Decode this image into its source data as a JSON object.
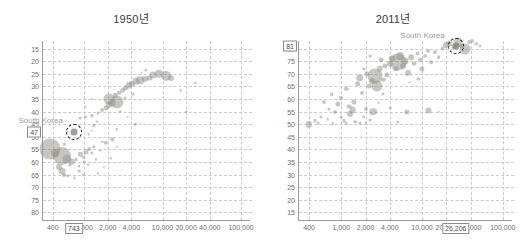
{
  "figure": {
    "panels": [
      {
        "id": "1950",
        "title": "1950년",
        "country_label": "South Korea",
        "y_callout": "47",
        "x_callout": "743"
      },
      {
        "id": "2011",
        "title": "2011년",
        "country_label": "South Korea",
        "y_callout": "81",
        "x_callout": "26,206"
      }
    ]
  },
  "chart_data": [
    {
      "type": "scatter",
      "title": "1950년",
      "xlabel": "",
      "ylabel": "",
      "xscale": "log",
      "xlim": [
        300,
        130000
      ],
      "ylim": [
        12,
        83
      ],
      "grid": true,
      "legend": null,
      "xticks": [
        400,
        1000,
        2000,
        4000,
        10000,
        20000,
        40000,
        100000
      ],
      "xticklabels": [
        "400",
        "1,000",
        "2,000",
        "4,000",
        "10,000",
        "20,000",
        "40,000",
        "100,000"
      ],
      "yticks": [
        15,
        20,
        25,
        30,
        35,
        40,
        45,
        50,
        55,
        60,
        65,
        70,
        75,
        80
      ],
      "yticklabels": [
        "15",
        "20",
        "25",
        "30",
        "35",
        "40",
        "45",
        "50",
        "55",
        "60",
        "65",
        "70",
        "75",
        "80"
      ],
      "annotations": [
        {
          "text": "South Korea",
          "x": 743,
          "y": 47,
          "highlight": true,
          "callout_x": "743",
          "callout_y": "47"
        }
      ],
      "points": [
        {
          "x": 370,
          "y": 40.0,
          "r": 10.5
        },
        {
          "x": 520,
          "y": 37.5,
          "r": 9.0
        },
        {
          "x": 430,
          "y": 38.5,
          "r": 4.0
        },
        {
          "x": 600,
          "y": 36.0,
          "r": 4.5
        },
        {
          "x": 480,
          "y": 33.0,
          "r": 3.0
        },
        {
          "x": 520,
          "y": 31.5,
          "r": 3.5
        },
        {
          "x": 560,
          "y": 30.0,
          "r": 2.0
        },
        {
          "x": 620,
          "y": 29.5,
          "r": 1.8
        },
        {
          "x": 700,
          "y": 35.2,
          "r": 3.2
        },
        {
          "x": 660,
          "y": 34.0,
          "r": 1.6
        },
        {
          "x": 780,
          "y": 36.0,
          "r": 1.6
        },
        {
          "x": 860,
          "y": 33.5,
          "r": 1.6
        },
        {
          "x": 900,
          "y": 38.0,
          "r": 2.2
        },
        {
          "x": 980,
          "y": 37.0,
          "r": 1.6
        },
        {
          "x": 1050,
          "y": 39.0,
          "r": 2.6
        },
        {
          "x": 1150,
          "y": 40.0,
          "r": 2.0
        },
        {
          "x": 1250,
          "y": 38.5,
          "r": 1.6
        },
        {
          "x": 1330,
          "y": 41.0,
          "r": 1.8
        },
        {
          "x": 1000,
          "y": 35.0,
          "r": 1.4
        },
        {
          "x": 1120,
          "y": 34.0,
          "r": 1.4
        },
        {
          "x": 860,
          "y": 31.5,
          "r": 1.4
        },
        {
          "x": 760,
          "y": 28.5,
          "r": 1.4
        },
        {
          "x": 980,
          "y": 30.0,
          "r": 1.2
        },
        {
          "x": 1400,
          "y": 36.0,
          "r": 1.2
        },
        {
          "x": 1600,
          "y": 39.5,
          "r": 1.4
        },
        {
          "x": 1900,
          "y": 42.5,
          "r": 2.2
        },
        {
          "x": 2300,
          "y": 44.0,
          "r": 1.6
        },
        {
          "x": 1700,
          "y": 43.0,
          "r": 1.3
        },
        {
          "x": 1150,
          "y": 46.0,
          "r": 1.3
        },
        {
          "x": 1250,
          "y": 47.5,
          "r": 1.3
        },
        {
          "x": 1350,
          "y": 49.5,
          "r": 1.6
        },
        {
          "x": 1450,
          "y": 51.0,
          "r": 1.4
        },
        {
          "x": 900,
          "y": 52.5,
          "r": 1.4
        },
        {
          "x": 1050,
          "y": 53.0,
          "r": 1.8
        },
        {
          "x": 1250,
          "y": 53.5,
          "r": 1.6
        },
        {
          "x": 1500,
          "y": 54.5,
          "r": 1.6
        },
        {
          "x": 1700,
          "y": 55.5,
          "r": 2.0
        },
        {
          "x": 1900,
          "y": 56.5,
          "r": 2.4
        },
        {
          "x": 2100,
          "y": 57.5,
          "r": 3.0
        },
        {
          "x": 2300,
          "y": 58.5,
          "r": 3.4
        },
        {
          "x": 2100,
          "y": 60.0,
          "r": 5.5
        },
        {
          "x": 2600,
          "y": 59.0,
          "r": 6.5
        },
        {
          "x": 2500,
          "y": 61.5,
          "r": 2.2
        },
        {
          "x": 2800,
          "y": 62.5,
          "r": 2.2
        },
        {
          "x": 3100,
          "y": 63.5,
          "r": 2.6
        },
        {
          "x": 3400,
          "y": 64.5,
          "r": 2.8
        },
        {
          "x": 3700,
          "y": 65.5,
          "r": 3.2
        },
        {
          "x": 4100,
          "y": 66.0,
          "r": 3.0
        },
        {
          "x": 4600,
          "y": 67.0,
          "r": 3.4
        },
        {
          "x": 5200,
          "y": 67.5,
          "r": 3.8
        },
        {
          "x": 6000,
          "y": 68.0,
          "r": 3.0
        },
        {
          "x": 6800,
          "y": 68.5,
          "r": 2.6
        },
        {
          "x": 7600,
          "y": 69.5,
          "r": 3.6
        },
        {
          "x": 9000,
          "y": 70.0,
          "r": 4.2
        },
        {
          "x": 11000,
          "y": 69.0,
          "r": 5.0
        },
        {
          "x": 13000,
          "y": 68.5,
          "r": 3.0
        },
        {
          "x": 6200,
          "y": 71.5,
          "r": 1.6
        },
        {
          "x": 5400,
          "y": 70.5,
          "r": 1.4
        },
        {
          "x": 3300,
          "y": 60.5,
          "r": 1.4
        },
        {
          "x": 4200,
          "y": 62.0,
          "r": 1.4
        },
        {
          "x": 2900,
          "y": 55.0,
          "r": 1.4
        },
        {
          "x": 3600,
          "y": 53.0,
          "r": 1.3
        },
        {
          "x": 4500,
          "y": 50.0,
          "r": 1.3
        },
        {
          "x": 2600,
          "y": 48.0,
          "r": 1.3
        },
        {
          "x": 1800,
          "y": 33.0,
          "r": 1.2
        },
        {
          "x": 2200,
          "y": 36.5,
          "r": 1.2
        },
        {
          "x": 2600,
          "y": 41.0,
          "r": 1.2
        },
        {
          "x": 1500,
          "y": 30.5,
          "r": 1.2
        },
        {
          "x": 620,
          "y": 47.0,
          "r": 1.2
        },
        {
          "x": 560,
          "y": 42.0,
          "r": 1.2
        },
        {
          "x": 1050,
          "y": 57.0,
          "r": 1.2
        },
        {
          "x": 1250,
          "y": 60.0,
          "r": 1.2
        },
        {
          "x": 17000,
          "y": 63.5,
          "r": 1.3
        },
        {
          "x": 20000,
          "y": 55.0,
          "r": 1.3
        },
        {
          "x": 26000,
          "y": 66.5,
          "r": 1.2
        }
      ]
    },
    {
      "type": "scatter",
      "title": "2011년",
      "xlabel": "",
      "ylabel": "",
      "xscale": "log",
      "xlim": [
        300,
        130000
      ],
      "ylim": [
        12,
        83
      ],
      "grid": true,
      "legend": null,
      "xticks": [
        400,
        1000,
        2000,
        4000,
        10000,
        20000,
        40000,
        100000
      ],
      "xticklabels": [
        "400",
        "1,000",
        "2,000",
        "4,000",
        "10,000",
        "20,000",
        "40,000",
        "100,000"
      ],
      "yticks": [
        15,
        20,
        25,
        30,
        35,
        40,
        45,
        50,
        55,
        60,
        65,
        70,
        75,
        80
      ],
      "yticklabels": [
        "81",
        "75",
        "70",
        "65",
        "60",
        "55",
        "50",
        "45",
        "40",
        "35",
        "30",
        "25",
        "20",
        "15"
      ],
      "annotations": [
        {
          "text": "South Korea",
          "x": 26206,
          "y": 81,
          "highlight": true,
          "callout_x": "26,206",
          "callout_y": "81"
        }
      ],
      "points": [
        {
          "x": 400,
          "y": 50.0,
          "r": 3.2
        },
        {
          "x": 470,
          "y": 51.5,
          "r": 1.6
        },
        {
          "x": 520,
          "y": 50.5,
          "r": 1.5
        },
        {
          "x": 560,
          "y": 53.0,
          "r": 1.5
        },
        {
          "x": 620,
          "y": 59.0,
          "r": 2.0
        },
        {
          "x": 700,
          "y": 56.0,
          "r": 1.6
        },
        {
          "x": 760,
          "y": 62.0,
          "r": 1.8
        },
        {
          "x": 840,
          "y": 55.0,
          "r": 2.0
        },
        {
          "x": 900,
          "y": 58.0,
          "r": 2.6
        },
        {
          "x": 980,
          "y": 53.0,
          "r": 1.6
        },
        {
          "x": 1000,
          "y": 60.5,
          "r": 2.0
        },
        {
          "x": 1080,
          "y": 51.5,
          "r": 1.6
        },
        {
          "x": 1150,
          "y": 64.0,
          "r": 2.2
        },
        {
          "x": 1250,
          "y": 57.0,
          "r": 2.4
        },
        {
          "x": 1300,
          "y": 54.0,
          "r": 3.0
        },
        {
          "x": 1380,
          "y": 55.5,
          "r": 3.4
        },
        {
          "x": 1450,
          "y": 59.0,
          "r": 2.6
        },
        {
          "x": 1500,
          "y": 51.0,
          "r": 1.8
        },
        {
          "x": 1600,
          "y": 66.0,
          "r": 2.8
        },
        {
          "x": 1700,
          "y": 68.5,
          "r": 3.8
        },
        {
          "x": 1800,
          "y": 62.5,
          "r": 2.0
        },
        {
          "x": 1900,
          "y": 53.0,
          "r": 1.8
        },
        {
          "x": 2000,
          "y": 56.0,
          "r": 2.0
        },
        {
          "x": 2100,
          "y": 70.0,
          "r": 2.6
        },
        {
          "x": 2200,
          "y": 65.0,
          "r": 2.4
        },
        {
          "x": 2400,
          "y": 67.0,
          "r": 3.0
        },
        {
          "x": 2500,
          "y": 55.0,
          "r": 3.8
        },
        {
          "x": 2600,
          "y": 69.0,
          "r": 7.5
        },
        {
          "x": 2800,
          "y": 65.0,
          "r": 5.5
        },
        {
          "x": 3000,
          "y": 72.0,
          "r": 3.2
        },
        {
          "x": 3100,
          "y": 75.5,
          "r": 2.4
        },
        {
          "x": 3300,
          "y": 67.5,
          "r": 2.2
        },
        {
          "x": 3500,
          "y": 73.0,
          "r": 2.6
        },
        {
          "x": 3700,
          "y": 69.5,
          "r": 2.6
        },
        {
          "x": 4000,
          "y": 74.0,
          "r": 3.2
        },
        {
          "x": 4300,
          "y": 76.0,
          "r": 3.4
        },
        {
          "x": 4700,
          "y": 72.0,
          "r": 2.6
        },
        {
          "x": 5000,
          "y": 74.5,
          "r": 8.5
        },
        {
          "x": 5400,
          "y": 77.0,
          "r": 4.0
        },
        {
          "x": 5800,
          "y": 73.0,
          "r": 3.0
        },
        {
          "x": 6200,
          "y": 75.0,
          "r": 3.4
        },
        {
          "x": 6800,
          "y": 70.5,
          "r": 3.0
        },
        {
          "x": 7400,
          "y": 76.5,
          "r": 2.8
        },
        {
          "x": 8000,
          "y": 74.0,
          "r": 2.4
        },
        {
          "x": 8800,
          "y": 78.0,
          "r": 2.4
        },
        {
          "x": 9500,
          "y": 75.5,
          "r": 2.2
        },
        {
          "x": 10000,
          "y": 72.0,
          "r": 2.6
        },
        {
          "x": 11000,
          "y": 77.0,
          "r": 2.0
        },
        {
          "x": 12000,
          "y": 79.0,
          "r": 2.0
        },
        {
          "x": 13000,
          "y": 74.5,
          "r": 1.8
        },
        {
          "x": 14500,
          "y": 78.5,
          "r": 2.0
        },
        {
          "x": 16000,
          "y": 76.5,
          "r": 1.8
        },
        {
          "x": 18000,
          "y": 80.0,
          "r": 2.4
        },
        {
          "x": 20000,
          "y": 81.5,
          "r": 3.0
        },
        {
          "x": 22000,
          "y": 82.0,
          "r": 3.4
        },
        {
          "x": 25000,
          "y": 80.5,
          "r": 2.4
        },
        {
          "x": 28000,
          "y": 82.5,
          "r": 4.5
        },
        {
          "x": 31000,
          "y": 81.0,
          "r": 2.6
        },
        {
          "x": 34000,
          "y": 80.0,
          "r": 5.5
        },
        {
          "x": 38000,
          "y": 82.5,
          "r": 2.0
        },
        {
          "x": 42000,
          "y": 83.0,
          "r": 2.0
        },
        {
          "x": 47000,
          "y": 82.0,
          "r": 1.8
        },
        {
          "x": 52000,
          "y": 81.0,
          "r": 1.6
        },
        {
          "x": 6500,
          "y": 55.0,
          "r": 2.6
        },
        {
          "x": 5000,
          "y": 51.0,
          "r": 1.6
        },
        {
          "x": 4000,
          "y": 56.5,
          "r": 1.4
        },
        {
          "x": 3300,
          "y": 62.0,
          "r": 1.6
        },
        {
          "x": 2900,
          "y": 58.5,
          "r": 1.4
        },
        {
          "x": 12000,
          "y": 55.5,
          "r": 2.6
        },
        {
          "x": 16000,
          "y": 55.0,
          "r": 1.3
        },
        {
          "x": 1150,
          "y": 50.5,
          "r": 1.5
        },
        {
          "x": 1700,
          "y": 50.5,
          "r": 1.5
        },
        {
          "x": 2000,
          "y": 50.5,
          "r": 1.4
        },
        {
          "x": 2300,
          "y": 51.5,
          "r": 1.4
        },
        {
          "x": 780,
          "y": 50.5,
          "r": 1.3
        },
        {
          "x": 680,
          "y": 52.0,
          "r": 1.3
        },
        {
          "x": 1900,
          "y": 72.0,
          "r": 1.6
        },
        {
          "x": 2300,
          "y": 77.0,
          "r": 1.4
        },
        {
          "x": 9000,
          "y": 68.0,
          "r": 1.6
        },
        {
          "x": 7000,
          "y": 66.5,
          "r": 1.4
        }
      ]
    }
  ]
}
